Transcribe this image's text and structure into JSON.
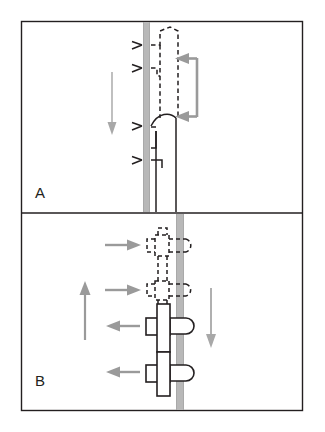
{
  "figure": {
    "type": "diagram",
    "width": 325,
    "height": 432,
    "background_color": "#ffffff",
    "frame": {
      "stroke_color": "#231f20",
      "stroke_width": 1.4,
      "x": 21,
      "y": 21,
      "width": 282,
      "height": 390,
      "divider_y": 213
    }
  },
  "colors": {
    "outline_black": "#231f20",
    "membrane_gray": "#b8b8b8",
    "arrow_gray": "#9a9a9a",
    "thin_arrow_gray": "#a8a8a8",
    "white": "#ffffff"
  },
  "panels": [
    {
      "id": "A",
      "label": "A",
      "label_x": 35,
      "label_y": 184,
      "description": "Side view: vertical membrane band with dashed (forming) and solid (formed) hook-shaped structures, a long downward motion arrow on the left, chevron markers along the membrane, and a gray bracket arrow on the right.",
      "membrane": {
        "orientation": "vertical",
        "x": 143,
        "y_top": 24,
        "y_bottom": 210,
        "width": 7,
        "color": "#b8b8b8"
      },
      "solid_vertical_lines": [
        {
          "x": 156,
          "y_top": 118,
          "y_bottom": 210
        },
        {
          "x": 176,
          "y_top": 118,
          "y_bottom": 210
        }
      ],
      "dashed_structure": {
        "style": "dashed",
        "note": "Upper hook/loop drawn with dashed stroke, open at bottom",
        "stroke_dasharray": "4 3"
      },
      "solid_structure": {
        "style": "solid",
        "note": "Lower hook/loop drawn with solid stroke, curved cap at top"
      },
      "chevron_markers": {
        "count": 4,
        "direction": "left",
        "color": "#231f20",
        "y_positions": [
          45,
          68,
          125,
          160
        ]
      },
      "motion_arrow": {
        "direction": "down",
        "color": "#a8a8a8",
        "x": 112,
        "y_start": 72,
        "y_end": 134
      },
      "bracket_arrow": {
        "shape": "c-bracket",
        "color": "#9a9a9a",
        "arrowhead_count": 2,
        "arrowhead_direction": "left",
        "y_top": 57,
        "y_bottom": 118,
        "x_right": 199
      }
    },
    {
      "id": "B",
      "label": "B",
      "label_x": 35,
      "label_y": 372,
      "description": "Top view: vertical membrane band crossed by four cross-shaped structures; upper two dashed (forming), lower two solid (formed). Horizontal gray arrows point right at dashed structures and left at solid structures. A long upward gray arrow is on the left and a downward gray arrow on the right.",
      "membrane": {
        "orientation": "vertical",
        "x": 176,
        "y_top": 216,
        "y_bottom": 409,
        "width": 8,
        "color": "#b8b8b8"
      },
      "structures": [
        {
          "index": 1,
          "style": "dashed",
          "center_y": 245,
          "arrow_direction": "right"
        },
        {
          "index": 2,
          "style": "dashed",
          "center_y": 291,
          "arrow_direction": "right"
        },
        {
          "index": 3,
          "style": "solid",
          "center_y": 326,
          "arrow_direction": "left"
        },
        {
          "index": 4,
          "style": "solid",
          "center_y": 373,
          "arrow_direction": "left"
        }
      ],
      "horizontal_arrows": [
        {
          "direction": "right",
          "y": 245,
          "x_start": 105,
          "x_end": 140,
          "color": "#9a9a9a"
        },
        {
          "direction": "right",
          "y": 291,
          "x_start": 105,
          "x_end": 140,
          "color": "#9a9a9a"
        },
        {
          "direction": "left",
          "y": 326,
          "x_start": 140,
          "x_end": 105,
          "color": "#9a9a9a"
        },
        {
          "direction": "left",
          "y": 373,
          "x_start": 140,
          "x_end": 105,
          "color": "#9a9a9a"
        }
      ],
      "vertical_arrows": [
        {
          "direction": "up",
          "x": 85,
          "y_start": 340,
          "y_end": 283,
          "color": "#9a9a9a"
        },
        {
          "direction": "down",
          "x": 211,
          "y_start": 288,
          "y_end": 347,
          "color": "#a8a8a8"
        }
      ]
    }
  ]
}
